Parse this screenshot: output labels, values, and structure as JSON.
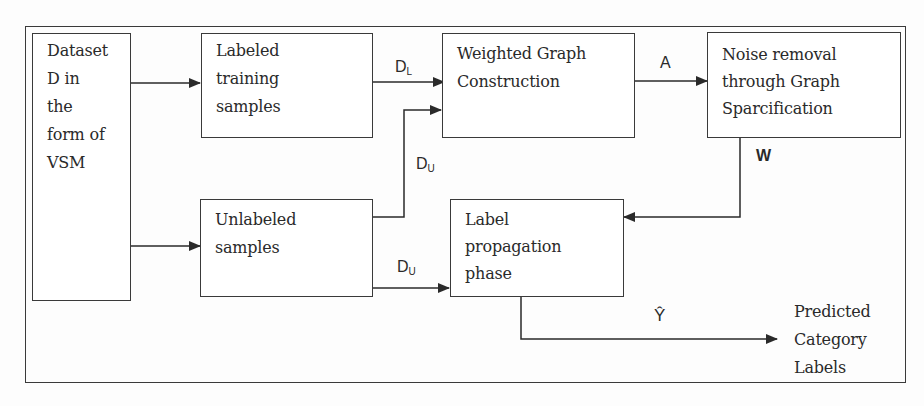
{
  "diagram": {
    "nodes": {
      "dataset": {
        "label": "Dataset\nD in\nthe\nform of\nVSM"
      },
      "labeled": {
        "label": "Labeled\ntraining\nsamples"
      },
      "unlabeled": {
        "label": "Unlabeled\nsamples"
      },
      "weighted_graph": {
        "label": "Weighted Graph\nConstruction"
      },
      "noise_removal": {
        "label": "Noise removal\nthrough Graph\nSparcification"
      },
      "label_propagation": {
        "label": "Label\npropagation\nphase"
      },
      "output": {
        "label": "Predicted\nCategory\nLabels"
      }
    },
    "edges": {
      "dl": {
        "main": "D",
        "sub": "L"
      },
      "du_upper": {
        "main": "D",
        "sub": "U"
      },
      "du_lower": {
        "main": "D",
        "sub": "U"
      },
      "a": {
        "main": "A"
      },
      "w": {
        "main": "W"
      },
      "yhat": {
        "main": "Ŷ"
      }
    },
    "colors": {
      "stroke": "#3a3a3a",
      "background": "#fdfdfd"
    }
  }
}
